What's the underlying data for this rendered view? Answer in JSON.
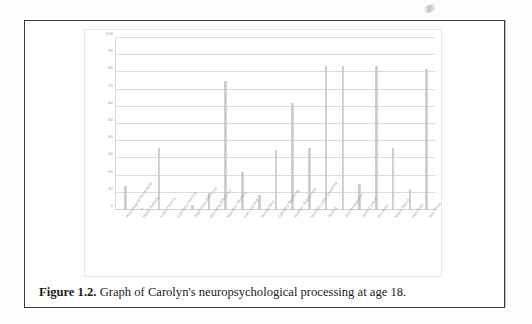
{
  "figure": {
    "caption_label": "Figure 1.2.",
    "caption_text": " Graph of Carolyn's neuropsychological processing at age 18."
  },
  "chart_data": {
    "type": "bar",
    "title": "",
    "xlabel": "",
    "ylabel": "",
    "ylim": [
      0,
      100
    ],
    "yticks": [
      0,
      10,
      20,
      30,
      40,
      50,
      60,
      70,
      80,
      90,
      100
    ],
    "grid": true,
    "legend": "none",
    "bar_color": "#c6c6c6",
    "categories": [
      "Phonological Processing",
      "Rapid Naming",
      "Letter Fluency",
      "Category Fluency",
      "Sight Word Efficiency",
      "Decoding Efficiency",
      "Narrative Memory",
      "List Learning",
      "Recognition",
      "Category Switching",
      "Number Sequencing",
      "Number-Letter Switching",
      "Sorting",
      "Sort Recognition",
      "Word Context",
      "Proverbs",
      "Motor Speed",
      "Rey Copy",
      "Rey Delay"
    ],
    "values": [
      14,
      1,
      36,
      0.5,
      3,
      10,
      75,
      22,
      9,
      35,
      62,
      36,
      84,
      84,
      15,
      84,
      36,
      12,
      82
    ]
  }
}
